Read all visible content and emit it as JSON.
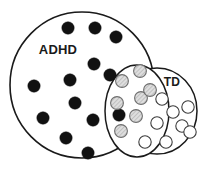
{
  "figure": {
    "type": "venn-diagram",
    "canvas": {
      "width": 208,
      "height": 173,
      "background": "#ffffff"
    },
    "title": "",
    "colors": {
      "outline": "#1a1a1a",
      "label_text": "#1a1a1a",
      "filled_dot": "#111111",
      "open_dot_stroke": "#3b3b3b",
      "open_dot_fill": "#ffffff",
      "hatched_dot_stroke": "#6e6e6e",
      "hatched_dot_fill": "#d9d9d9",
      "background": "#ffffff"
    }
  },
  "sets": [
    {
      "id": "adhd",
      "label": "ADHD",
      "shape": "ellipse",
      "cx": 82,
      "cy": 85,
      "rx": 72,
      "ry": 73,
      "stroke_width": 1.6,
      "label_x": 58,
      "label_y": 51,
      "label_size": 13,
      "marker_style": "filled-black"
    },
    {
      "id": "overlap",
      "label": "",
      "shape": "ellipse",
      "cx": 137,
      "cy": 111,
      "rx": 32,
      "ry": 46,
      "rotation": 0,
      "stroke_width": 1.5,
      "marker_style": "gray-hatched"
    },
    {
      "id": "td",
      "label": "TD",
      "shape": "ellipse",
      "cx": 157,
      "cy": 111,
      "rx": 40,
      "ry": 43,
      "stroke_width": 1.5,
      "label_x": 172,
      "label_y": 83,
      "label_size": 12,
      "marker_style": "open-white"
    }
  ],
  "markers": {
    "filled_black": {
      "name": "adhd-only-dot",
      "count": 13,
      "radius": 6.2,
      "points": [
        {
          "cx": 68,
          "cy": 28
        },
        {
          "cx": 95,
          "cy": 28
        },
        {
          "cx": 116,
          "cy": 37
        },
        {
          "cx": 94,
          "cy": 64
        },
        {
          "cx": 70,
          "cy": 80
        },
        {
          "cx": 34,
          "cy": 86
        },
        {
          "cx": 75,
          "cy": 103
        },
        {
          "cx": 43,
          "cy": 118
        },
        {
          "cx": 93,
          "cy": 120
        },
        {
          "cx": 66,
          "cy": 138
        },
        {
          "cx": 88,
          "cy": 153
        },
        {
          "cx": 119,
          "cy": 115
        },
        {
          "cx": 110,
          "cy": 75
        }
      ]
    },
    "gray_hatched": {
      "name": "overlap-dot",
      "count": 7,
      "radius": 6.4,
      "points": [
        {
          "cx": 140,
          "cy": 71
        },
        {
          "cx": 122,
          "cy": 81
        },
        {
          "cx": 141,
          "cy": 98
        },
        {
          "cx": 117,
          "cy": 103
        },
        {
          "cx": 136,
          "cy": 116
        },
        {
          "cx": 121,
          "cy": 131
        },
        {
          "cx": 150,
          "cy": 90
        }
      ]
    },
    "open_white": {
      "name": "td-only-dot",
      "count": 8,
      "radius": 6.2,
      "points": [
        {
          "cx": 162,
          "cy": 99
        },
        {
          "cx": 188,
          "cy": 107
        },
        {
          "cx": 157,
          "cy": 123
        },
        {
          "cx": 182,
          "cy": 126
        },
        {
          "cx": 145,
          "cy": 142
        },
        {
          "cx": 166,
          "cy": 142
        },
        {
          "cx": 190,
          "cy": 132
        },
        {
          "cx": 173,
          "cy": 112
        }
      ]
    }
  },
  "legend": {
    "present": false,
    "entries": [
      {
        "marker": "filled-black",
        "meaning": "ADHD"
      },
      {
        "marker": "gray-hatched",
        "meaning": "overlap"
      },
      {
        "marker": "open-white",
        "meaning": "TD"
      }
    ]
  }
}
